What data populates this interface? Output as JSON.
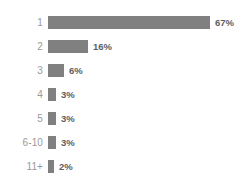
{
  "chart_data": {
    "type": "bar",
    "orientation": "horizontal",
    "title": "",
    "subtitle": "",
    "xlabel": "",
    "ylabel": "",
    "categories": [
      "1",
      "2",
      "3",
      "4",
      "5",
      "6-10",
      "11+"
    ],
    "values": [
      67,
      16,
      6,
      3,
      3,
      3,
      2
    ],
    "value_labels": [
      "67%",
      "16%",
      "6%",
      "3%",
      "3%",
      "3%",
      "2%"
    ],
    "xlim": [
      0,
      67
    ],
    "grid": false,
    "legend": null,
    "axis_visible": false,
    "bar_color": "#808080",
    "category_label_color": "#9a9a9a",
    "value_label_color": "#5e5e5e",
    "background_color": "#ffffff"
  },
  "rows": [
    {
      "category": "1",
      "value_label": "67%",
      "bar_width_px": 162
    },
    {
      "category": "2",
      "value_label": "16%",
      "bar_width_px": 40
    },
    {
      "category": "3",
      "value_label": "6%",
      "bar_width_px": 16
    },
    {
      "category": "4",
      "value_label": "3%",
      "bar_width_px": 8
    },
    {
      "category": "5",
      "value_label": "3%",
      "bar_width_px": 8
    },
    {
      "category": "6-10",
      "value_label": "3%",
      "bar_width_px": 8
    },
    {
      "category": "11+",
      "value_label": "2%",
      "bar_width_px": 6
    }
  ]
}
